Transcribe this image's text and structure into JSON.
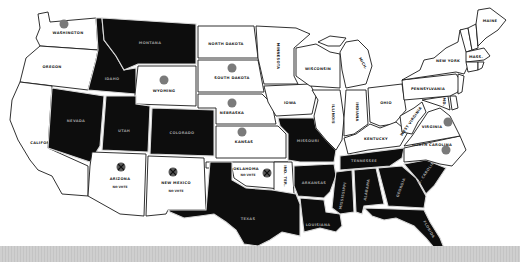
{
  "map": {
    "legend_meaning": {
      "white_with_dot": "state shown white with a gray dot",
      "black": "state shown solid black",
      "x_marker": "territory marked with an X"
    },
    "colors": {
      "light_state": "#ffffff",
      "dark_state": "#0d0d0d",
      "dot": "#7a7a7a",
      "border_light": "#1a1a1a",
      "border_dark": "#d8d8d8",
      "bottom_bar": "#cfcfcf"
    },
    "states": {
      "washington": {
        "label": "WASHINGTON",
        "shade": "light",
        "dot": true
      },
      "oregon": {
        "label": "OREGON",
        "shade": "light",
        "dot": false
      },
      "california": {
        "label": "CALIFORNIA",
        "shade": "light",
        "dot": false
      },
      "idaho": {
        "label": "IDAHO",
        "shade": "dark",
        "dot": false
      },
      "nevada": {
        "label": "NEVADA",
        "shade": "dark",
        "dot": false
      },
      "montana": {
        "label": "MONTANA",
        "shade": "dark",
        "dot": false
      },
      "wyoming": {
        "label": "WYOMING",
        "shade": "light",
        "dot": true
      },
      "utah": {
        "label": "UTAH",
        "shade": "dark",
        "dot": false
      },
      "colorado": {
        "label": "COLORADO",
        "shade": "dark",
        "dot": false
      },
      "arizona": {
        "label": "ARIZONA",
        "shade": "light",
        "dot": false,
        "x_marker": true,
        "note": "NO VOTE"
      },
      "new_mexico": {
        "label": "NEW MEXICO",
        "shade": "light",
        "dot": false,
        "x_marker": true,
        "note": "NO VOTE"
      },
      "north_dakota": {
        "label": "NORTH DAKOTA",
        "shade": "light",
        "dot": false
      },
      "south_dakota": {
        "label": "SOUTH DAKOTA",
        "shade": "light",
        "dot": true
      },
      "nebraska": {
        "label": "NEBRASKA",
        "shade": "light",
        "dot": true
      },
      "kansas": {
        "label": "KANSAS",
        "shade": "light",
        "dot": true
      },
      "oklahoma": {
        "label": "OKLAHOMA",
        "shade": "light",
        "dot": false,
        "x_marker": true,
        "note": "NO VOTE"
      },
      "indian_territory": {
        "label": "IND. TER.",
        "shade": "light",
        "dot": false
      },
      "texas": {
        "label": "TEXAS",
        "shade": "dark",
        "dot": false
      },
      "minnesota": {
        "label": "MINNESOTA",
        "shade": "light",
        "dot": false
      },
      "iowa": {
        "label": "IOWA",
        "shade": "light",
        "dot": false
      },
      "missouri": {
        "label": "MISSOURI",
        "shade": "dark",
        "dot": false
      },
      "arkansas": {
        "label": "ARKANSAS",
        "shade": "dark",
        "dot": false
      },
      "louisiana": {
        "label": "LOUISIANA",
        "shade": "dark",
        "dot": false
      },
      "wisconsin": {
        "label": "WISCONSIN",
        "shade": "light",
        "dot": false
      },
      "illinois": {
        "label": "ILLINOIS",
        "shade": "light",
        "dot": false
      },
      "michigan": {
        "label": "MICH.",
        "shade": "light",
        "dot": false
      },
      "indiana": {
        "label": "INDIANA",
        "shade": "light",
        "dot": false
      },
      "ohio": {
        "label": "OHIO",
        "shade": "light",
        "dot": false
      },
      "kentucky": {
        "label": "KENTUCKY",
        "shade": "light",
        "dot": false
      },
      "tennessee": {
        "label": "TENNESSEE",
        "shade": "dark",
        "dot": false
      },
      "mississippi": {
        "label": "MISSISSIPPI",
        "shade": "dark",
        "dot": false
      },
      "alabama": {
        "label": "ALABAMA",
        "shade": "dark",
        "dot": false
      },
      "georgia": {
        "label": "GEORGIA",
        "shade": "dark",
        "dot": false
      },
      "florida": {
        "label": "FLORIDA",
        "shade": "dark",
        "dot": false
      },
      "south_carolina": {
        "label": "S. CAROLINA",
        "shade": "dark",
        "dot": false
      },
      "north_carolina": {
        "label": "NORTH CAROLINA",
        "shade": "light",
        "dot": true
      },
      "virginia": {
        "label": "VIRGINIA",
        "shade": "light",
        "dot": true
      },
      "west_virginia": {
        "label": "WEST VIRGINIA",
        "shade": "light",
        "dot": false
      },
      "pennsylvania": {
        "label": "PENNSYLVANIA",
        "shade": "light",
        "dot": false
      },
      "new_york": {
        "label": "NEW YORK",
        "shade": "light",
        "dot": false
      },
      "maryland": {
        "label": "MD.",
        "shade": "light",
        "dot": false
      },
      "delaware": {
        "label": "DEL.",
        "shade": "light",
        "dot": false
      },
      "new_jersey": {
        "label": "N.J.",
        "shade": "light",
        "dot": false
      },
      "vermont": {
        "label": "VT.",
        "shade": "light",
        "dot": false
      },
      "new_hampshire": {
        "label": "N.H.",
        "shade": "light",
        "dot": false
      },
      "maine": {
        "label": "MAINE",
        "shade": "light",
        "dot": false
      },
      "massachusetts": {
        "label": "MASS.",
        "shade": "light",
        "dot": false
      },
      "connecticut": {
        "label": "CONN.",
        "shade": "light",
        "dot": false
      },
      "rhode_island": {
        "label": "R.I.",
        "shade": "light",
        "dot": false
      }
    }
  }
}
